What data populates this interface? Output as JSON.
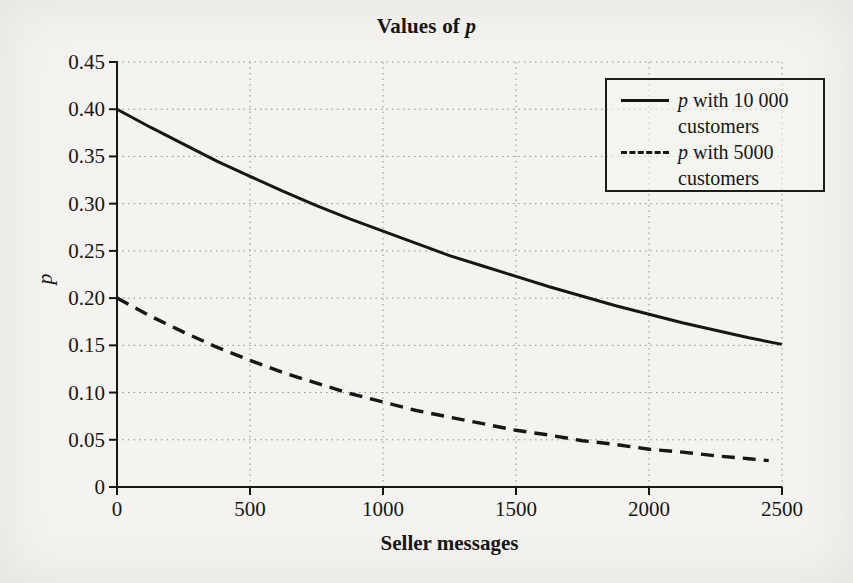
{
  "header": {
    "title_text": "Values of ",
    "title_var": "p"
  },
  "legend": {
    "items": [
      {
        "var": "p",
        "text": " with 10 000 customers",
        "style": "solid"
      },
      {
        "var": "p",
        "text": " with 5000 customers",
        "style": "dashed"
      }
    ]
  },
  "colors": {
    "ink": "#161616",
    "grid": "#8f8f8f",
    "background": "#f4f3ef"
  },
  "chart_data": {
    "type": "line",
    "title": "Values of p",
    "xlabel": "Seller messages",
    "ylabel": "p",
    "xlim": [
      0,
      2500
    ],
    "ylim": [
      0,
      0.45
    ],
    "grid": true,
    "legend_position": "top-right",
    "xticks": [
      {
        "v": 0,
        "label": "0"
      },
      {
        "v": 500,
        "label": "500"
      },
      {
        "v": 1000,
        "label": "1000"
      },
      {
        "v": 1500,
        "label": "1500"
      },
      {
        "v": 2000,
        "label": "2000"
      },
      {
        "v": 2500,
        "label": "2500"
      }
    ],
    "yticks": [
      {
        "v": 0,
        "label": "0"
      },
      {
        "v": 0.05,
        "label": "0.05"
      },
      {
        "v": 0.1,
        "label": "0.10"
      },
      {
        "v": 0.15,
        "label": "0.15"
      },
      {
        "v": 0.2,
        "label": "0.20"
      },
      {
        "v": 0.25,
        "label": "0.25"
      },
      {
        "v": 0.3,
        "label": "0.30"
      },
      {
        "v": 0.35,
        "label": "0.35"
      },
      {
        "v": 0.4,
        "label": "0.40"
      },
      {
        "v": 0.45,
        "label": "0.45"
      }
    ],
    "series": [
      {
        "name": "p with 10 000 customers",
        "style": "solid",
        "x": [
          0,
          125,
          250,
          375,
          500,
          625,
          750,
          875,
          1000,
          1125,
          1250,
          1375,
          1500,
          1625,
          1750,
          1875,
          2000,
          2125,
          2250,
          2375,
          2500
        ],
        "y": [
          0.4,
          0.381,
          0.363,
          0.345,
          0.329,
          0.313,
          0.298,
          0.284,
          0.271,
          0.258,
          0.245,
          0.234,
          0.223,
          0.212,
          0.202,
          0.192,
          0.183,
          0.174,
          0.166,
          0.158,
          0.151
        ]
      },
      {
        "name": "p with 5000 customers",
        "style": "dashed",
        "x": [
          0,
          125,
          250,
          375,
          500,
          625,
          750,
          875,
          1000,
          1125,
          1250,
          1375,
          1500,
          1625,
          1750,
          1875,
          2000,
          2125,
          2250,
          2375,
          2450
        ],
        "y": [
          0.2,
          0.181,
          0.164,
          0.148,
          0.134,
          0.121,
          0.11,
          0.099,
          0.09,
          0.081,
          0.074,
          0.067,
          0.06,
          0.055,
          0.049,
          0.045,
          0.04,
          0.037,
          0.033,
          0.03,
          0.028
        ]
      }
    ]
  }
}
